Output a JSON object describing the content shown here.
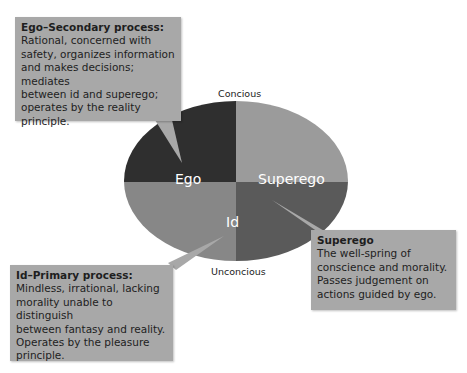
{
  "diagram": {
    "axis_labels": {
      "top": "Concious",
      "bottom": "Unconcious"
    },
    "segments": {
      "ego": {
        "label": "Ego",
        "color": "#2f2f2f"
      },
      "superego_top": {
        "color": "#9b9b9b"
      },
      "superego": {
        "label": "Superego",
        "color": "#5a5a5a"
      },
      "id": {
        "label": "Id",
        "color": "#878787"
      }
    },
    "callouts": {
      "ego": {
        "title": "Ego–Secondary process:",
        "body": "Rational, concerned with\nsafety,  organizes information\nand makes decisions; mediates\nbetween id and superego;\noperates by the reality principle."
      },
      "superego": {
        "title": "Superego",
        "body": "The well-spring of\nconscience and morality.\nPasses judgement on\nactions guided by ego."
      },
      "id": {
        "title": "Id–Primary process:",
        "body": "Mindless, irrational, lacking\nmorality unable to distinguish\nbetween fantasy and reality.\nOperates by the pleasure\nprinciple."
      }
    },
    "box_color": "#a8a8a8"
  }
}
